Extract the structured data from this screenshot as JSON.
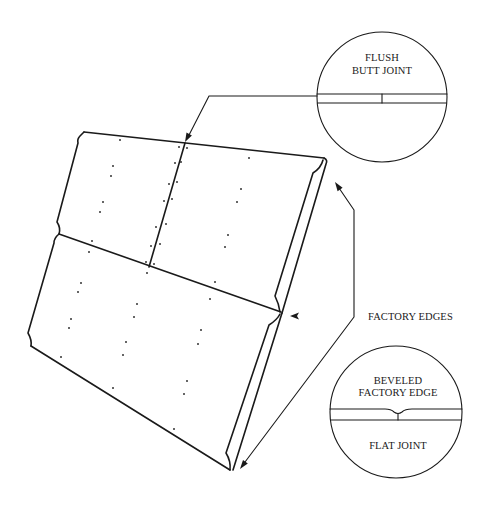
{
  "diagram": {
    "type": "technical-illustration",
    "colors": {
      "line": "#1a1a1a",
      "background": "#ffffff"
    }
  },
  "callouts": {
    "flush_butt_joint": {
      "line1": "FLUSH",
      "line2": "BUTT JOINT"
    },
    "beveled_edge": {
      "line1": "BEVELED",
      "line2": "FACTORY EDGE",
      "line3": "FLAT JOINT"
    },
    "factory_edges": {
      "label": "FACTORY EDGES"
    }
  }
}
